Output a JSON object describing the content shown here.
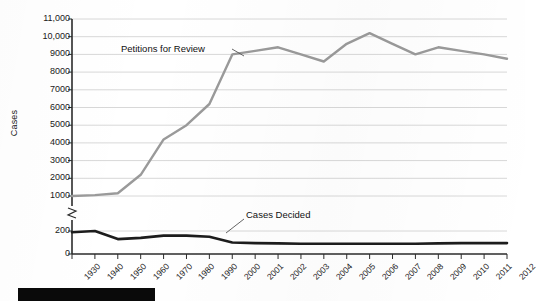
{
  "chart_data": {
    "type": "line",
    "title": "",
    "xlabel": "",
    "ylabel": "Cases",
    "grid": true,
    "legend_position": "inline-annotations",
    "axis_break": {
      "present": true,
      "below": 200,
      "above": 1000
    },
    "y_upper_ticks": [
      "1000",
      "2000",
      "3000",
      "4000",
      "5000",
      "6000",
      "7000",
      "8000",
      "9000",
      "10,000",
      "11,000"
    ],
    "y_lower_ticks": [
      "0",
      "200"
    ],
    "ylim_upper": [
      1000,
      11000
    ],
    "ylim_lower": [
      0,
      200
    ],
    "categories": [
      "1930",
      "1940",
      "1950",
      "1960",
      "1970",
      "1980",
      "1990",
      "2000",
      "2001",
      "2002",
      "2003",
      "2004",
      "2005",
      "2006",
      "2007",
      "2008",
      "2009",
      "2010",
      "2011",
      "2012"
    ],
    "series": [
      {
        "name": "Petitions for Review",
        "color": "#9a9a9a",
        "values": [
          1000,
          1050,
          1150,
          2200,
          4200,
          5000,
          6200,
          9000,
          9200,
          9400,
          9000,
          8600,
          9600,
          10200,
          9600,
          9000,
          9400,
          9200,
          9000,
          8750
        ]
      },
      {
        "name": "Cases Decided",
        "color": "#1c1c1c",
        "values": [
          190,
          200,
          130,
          140,
          160,
          160,
          150,
          100,
          95,
          92,
          90,
          90,
          90,
          90,
          90,
          90,
          92,
          95,
          95,
          95
        ]
      }
    ],
    "annotations": [
      {
        "text": "Petitions for Review",
        "target_category": "2000"
      },
      {
        "text": "Cases Decided",
        "target_category": "2000"
      }
    ]
  },
  "axis": {
    "y_title": "Cases"
  },
  "colors": {
    "petitions_line": "#9a9a9a",
    "cases_line": "#1c1c1c",
    "gridline": "#d8d8d8",
    "axis": "#2b2b2b",
    "background": "#ffffff",
    "footer_bar": "#0a0a0a"
  }
}
